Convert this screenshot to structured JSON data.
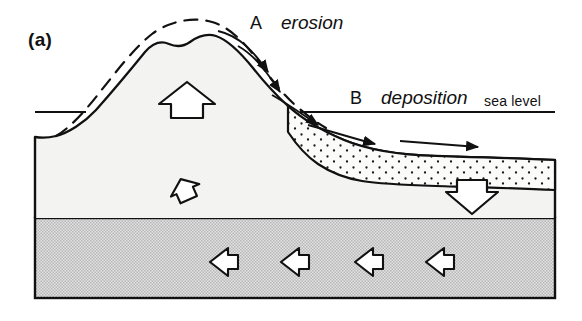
{
  "figure": {
    "panel_label": "(a)",
    "caption_labels": {
      "erosion_key": "A",
      "erosion_text": "erosion",
      "deposition_key": "B",
      "deposition_text": "deposition",
      "sea_level_text": "sea level"
    },
    "colors": {
      "ink": "#111111",
      "crust_fill": "#f4f4f2",
      "mantle_fill": "#d9d9d9",
      "sediment_fill": "#fbfbfa",
      "stipple_dot": "#1a1a1a",
      "background": "#ffffff"
    },
    "geometry": {
      "frame_left": 35,
      "frame_right": 555,
      "frame_bottom": 298,
      "layer_boundary_y": 218,
      "sea_level_y": 112,
      "sea_level_left_segment": [
        35,
        112,
        86,
        112
      ],
      "sea_level_right_segment": [
        300,
        112,
        555,
        112
      ]
    },
    "elements": {
      "original_profile": "dashed-uplifted-surface",
      "present_profile": "solid-eroded-mountain-surface",
      "sediment_wedge": "stippled-deposition-wedge",
      "uplift_arrow": "large-hollow-up-arrow",
      "small_uplift_arrow": "small-hollow-up-left-arrow",
      "subsidence_arrow": "large-hollow-down-arrow",
      "mantle_flow_arrows": "four-hollow-left-arrows",
      "erosion_transport_arrows": "two-curved-slope-arrows",
      "deposition_transport_arrows": "three-sediment-transport-arrows"
    },
    "mantle_arrow_count": 4,
    "erosion_arrow_count": 2,
    "deposition_arrow_count": 3
  }
}
